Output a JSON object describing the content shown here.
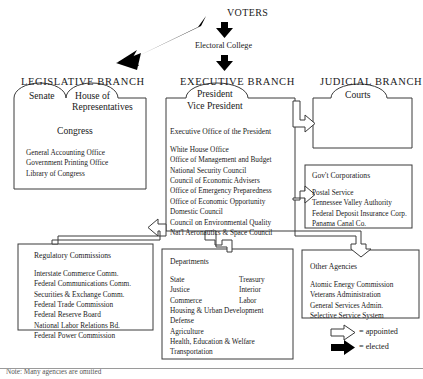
{
  "diagram": {
    "top": {
      "voters": "VOTERS",
      "electoral_college": "Electoral College"
    },
    "branch_titles": {
      "legislative": "LEGISLATIVE BRANCH",
      "executive": "EXECUTIVE BRANCH",
      "judicial": "JUDICIAL BRANCH"
    },
    "legislative": {
      "bump_left": "Senate",
      "bump_right_line1": "House of",
      "bump_right_line2": "Representatives",
      "heading": "Congress",
      "items": [
        "General Accounting Office",
        "Government Printing Office",
        "Library of Congress"
      ]
    },
    "executive": {
      "bump_line1": "President",
      "bump_line2": "Vice President",
      "heading": "Executive Office of the President",
      "items": [
        "White House Office",
        "Office of Management and Budget",
        "National Security Council",
        "Council of Economic Advisers",
        "Office of Emergency Preparedness",
        "Office of Economic Opportunity",
        "Domestic Council",
        "Council on Environmental Quality",
        "Nat'l Aeronautics & Space Council"
      ]
    },
    "judicial": {
      "bump": "Courts"
    },
    "gov_corporations": {
      "heading": "Gov't Corporations",
      "items": [
        "Postal Service",
        "Tennessee Valley Authority",
        "Federal Deposit Insurance Corp.",
        "Panama Canal Co."
      ]
    },
    "regulatory_commissions": {
      "heading": "Regulatory Commissions",
      "items": [
        "Interstate Commerce Comm.",
        "Federal Communications Comm.",
        "Securities & Exchange Comm.",
        "Federal Trade Commission",
        "Federal Reserve Board",
        "National Labor Relations Bd.",
        "Federal Power Commission"
      ]
    },
    "departments": {
      "heading": "Departments",
      "col1": [
        "State",
        "Justice",
        "Commerce"
      ],
      "col2": [
        "Treasury",
        "Interior",
        "Labor"
      ],
      "wide": [
        "Housing & Urban Development",
        "Defense",
        "Agriculture",
        "Health, Education  & Welfare",
        "Transportation"
      ]
    },
    "other_agencies": {
      "heading": "Other Agencies",
      "items": [
        "Atomic Energy Commission",
        "Veterans Administration",
        "General Services Admin.",
        "Selective Service System"
      ]
    },
    "legend": {
      "appointed": "=  appointed",
      "elected": "=  elected"
    },
    "footer": "Note: Many agencies are omitted",
    "colors": {
      "ink": "#1a1a1a",
      "line": "#3a3a3a",
      "rule": "#9a9a9a"
    }
  }
}
